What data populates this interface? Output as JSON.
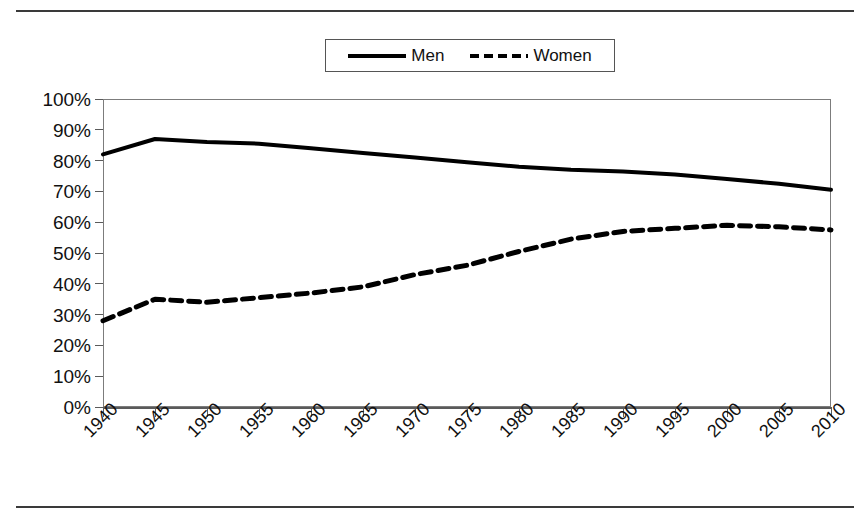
{
  "page": {
    "background_color": "#ffffff",
    "rule_color": "#3a3a3a"
  },
  "legend": {
    "position": "top-center",
    "entries": [
      {
        "label": "Men",
        "style": "solid",
        "color": "#000000"
      },
      {
        "label": "Women",
        "style": "dashed",
        "color": "#000000"
      }
    ]
  },
  "chart_data": {
    "type": "line",
    "title": "",
    "subtitle": "",
    "xlabel": "",
    "ylabel": "",
    "grid": false,
    "legend_position": "top-center",
    "categories": [
      "1940",
      "1945",
      "1950",
      "1955",
      "1960",
      "1965",
      "1970",
      "1975",
      "1980",
      "1985",
      "1990",
      "1995",
      "2000",
      "2005",
      "2010"
    ],
    "x_tick_rotation": -45,
    "ylim": [
      0,
      100
    ],
    "y_ticks": [
      0,
      10,
      20,
      30,
      40,
      50,
      60,
      70,
      80,
      90,
      100
    ],
    "y_tick_labels": [
      "0%",
      "10%",
      "20%",
      "30%",
      "40%",
      "50%",
      "60%",
      "70%",
      "80%",
      "90%",
      "100%"
    ],
    "y_unit": "%",
    "series": [
      {
        "name": "Men",
        "style": "solid",
        "color": "#000000",
        "line_width": 4,
        "values": [
          82,
          87,
          86,
          85.5,
          84,
          82.5,
          81,
          79.5,
          78,
          77,
          76.5,
          75.5,
          74,
          72.5,
          70.5
        ]
      },
      {
        "name": "Women",
        "style": "dashed",
        "color": "#000000",
        "line_width": 5,
        "dash_pattern": "11,7",
        "values": [
          28,
          35,
          34,
          35.5,
          37,
          39,
          43,
          46,
          50.5,
          54.5,
          57,
          58,
          59,
          58.5,
          57.5
        ]
      }
    ]
  },
  "plot_geometry": {
    "left": 103,
    "top": 99,
    "width": 728,
    "height": 308,
    "frame_color": "#7c7c7c",
    "axis_color": "#5a5a5a"
  }
}
